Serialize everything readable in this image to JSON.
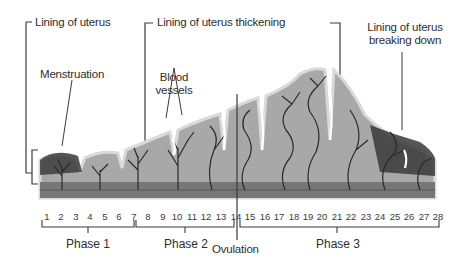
{
  "diagram": {
    "labels": {
      "lining": "Lining of uterus",
      "thickening": "Lining of uterus thickening",
      "breaking_down_line1": "Lining of uterus",
      "breaking_down_line2": "breaking down",
      "menstruation": "Menstruation",
      "blood_vessels_line1": "Blood",
      "blood_vessels_line2": "vessels",
      "ovulation": "Ovulation"
    },
    "days": [
      "1",
      "2",
      "3",
      "4",
      "5",
      "6",
      "7",
      "8",
      "9",
      "10",
      "11",
      "12",
      "13",
      "14",
      "15",
      "16",
      "17",
      "18",
      "19",
      "20",
      "21",
      "22",
      "23",
      "24",
      "25",
      "26",
      "27",
      "28"
    ],
    "phases": [
      {
        "label": "Phase 1",
        "start_day": 1,
        "end_day": 7
      },
      {
        "label": "Phase 2",
        "start_day": 7,
        "end_day": 14
      },
      {
        "label": "Phase 3",
        "start_day": 14,
        "end_day": 28
      }
    ],
    "colors": {
      "tissue": "#9a9a9a",
      "tissue_light": "#b9b9b9",
      "tissue_edge": "#d6d6d6",
      "vessel": "#2a2a2a",
      "base": "#6e6e6e",
      "line": "#3a3a3a"
    }
  }
}
